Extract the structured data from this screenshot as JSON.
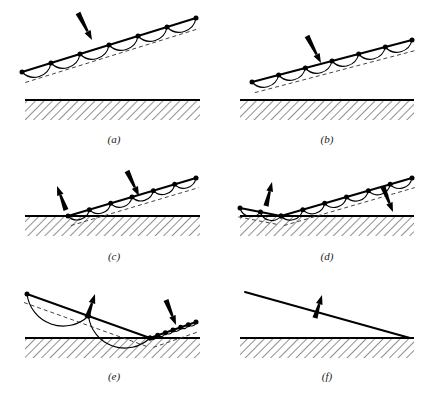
{
  "figure": {
    "background_color": "#ffffff",
    "ink_color": "#000000",
    "dashed_color": "#444444",
    "hatch_color": "#333333",
    "panel_count": 6
  },
  "panels": [
    {
      "id": "a",
      "caption": "(a)",
      "caption_x": 114,
      "caption_y": 133,
      "description": "Inclined segmented line high above ground, one downward arrow",
      "ground": {
        "x1": 25,
        "x2": 200,
        "y": 100,
        "hatch_depth": 20
      },
      "line": {
        "x1": 22,
        "y1": 72,
        "x2": 196,
        "y2": 18,
        "nodes": 7,
        "scallops": 6,
        "scallop_depth": 9,
        "dashed_offset": 11
      },
      "arrows": [
        {
          "name": "down-arrow",
          "x1": 78,
          "y1": 13,
          "x2": 92,
          "y2": 40,
          "direction": "down"
        }
      ]
    },
    {
      "id": "b",
      "caption": "(b)",
      "caption_x": 327,
      "caption_y": 133,
      "description": "Inclined segmented line lowered toward ground, one downward arrow",
      "ground": {
        "x1": 240,
        "x2": 414,
        "y": 100,
        "hatch_depth": 20
      },
      "line": {
        "x1": 252,
        "y1": 82,
        "x2": 412,
        "y2": 40,
        "nodes": 7,
        "scallops": 6,
        "scallop_depth": 9,
        "dashed_offset": 11
      },
      "arrows": [
        {
          "name": "down-arrow",
          "x1": 307,
          "y1": 36,
          "x2": 321,
          "y2": 63,
          "direction": "down"
        }
      ]
    },
    {
      "id": "c",
      "caption": "(c)",
      "caption_x": 114,
      "caption_y": 250,
      "description": "Line anchored at ground on left, upward arrow at contact, downward arrow on line",
      "ground": {
        "x1": 25,
        "x2": 200,
        "y": 216,
        "hatch_depth": 20
      },
      "line": {
        "x1": 68,
        "y1": 216,
        "x2": 196,
        "y2": 178,
        "nodes": 7,
        "scallops": 6,
        "scallop_depth": 9,
        "dashed_offset": 10
      },
      "arrows": [
        {
          "name": "up-arrow",
          "x1": 66,
          "y1": 210,
          "x2": 57,
          "y2": 186,
          "direction": "up"
        },
        {
          "name": "down-arrow",
          "x1": 127,
          "y1": 171,
          "x2": 139,
          "y2": 196,
          "direction": "down"
        }
      ]
    },
    {
      "id": "d",
      "caption": "(d)",
      "caption_x": 327,
      "caption_y": 250,
      "description": "Kinked V-shape line touching ground, upward arrow left, downward arrow right",
      "ground": {
        "x1": 240,
        "x2": 414,
        "y": 216,
        "hatch_depth": 20
      },
      "kink": {
        "vx": 281,
        "vy": 216,
        "left_x": 240,
        "left_y": 208,
        "right_x": 412,
        "right_y": 178
      },
      "arrows": [
        {
          "name": "up-arrow",
          "x1": 266,
          "y1": 206,
          "x2": 272,
          "y2": 182,
          "direction": "up"
        },
        {
          "name": "down-arrow",
          "x1": 383,
          "y1": 187,
          "x2": 393,
          "y2": 212,
          "direction": "down"
        }
      ]
    },
    {
      "id": "e",
      "caption": "(e)",
      "caption_x": 114,
      "caption_y": 370,
      "description": "Descending line meets ground then short rising segment to the right, two arrows",
      "ground": {
        "x1": 25,
        "x2": 200,
        "y": 338,
        "hatch_depth": 20
      },
      "kink": {
        "vx": 150,
        "vy": 338,
        "left_x": 27,
        "left_y": 294,
        "right_x": 196,
        "right_y": 322
      },
      "arrows": [
        {
          "name": "up-arrow",
          "x1": 87,
          "y1": 318,
          "x2": 95,
          "y2": 294,
          "direction": "up"
        },
        {
          "name": "down-arrow",
          "x1": 166,
          "y1": 300,
          "x2": 176,
          "y2": 325,
          "direction": "down"
        }
      ]
    },
    {
      "id": "f",
      "caption": "(f)",
      "caption_x": 327,
      "caption_y": 370,
      "description": "Plain straight line meeting ground at right, single upward arrow, no nodes or scallops",
      "ground": {
        "x1": 240,
        "x2": 414,
        "y": 338,
        "hatch_depth": 20
      },
      "line": {
        "x1": 245,
        "y1": 292,
        "x2": 410,
        "y2": 338,
        "nodes": 0,
        "scallops": 0
      },
      "arrows": [
        {
          "name": "up-arrow",
          "x1": 315,
          "y1": 318,
          "x2": 322,
          "y2": 295,
          "direction": "up"
        }
      ]
    }
  ]
}
